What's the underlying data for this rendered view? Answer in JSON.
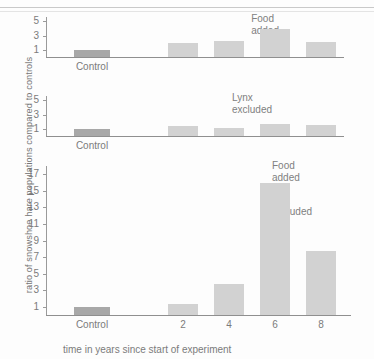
{
  "figure": {
    "y_axis_label": "ratio of snowshoe hare populations compared to controls",
    "x_axis_label": "time in years since start of experiment"
  },
  "chart_data": {
    "type": "bar",
    "title": "",
    "xlabel": "time in years since start of experiment",
    "ylabel": "ratio of snowshoe hare populations compared to controls",
    "categories": [
      "Control",
      "2",
      "4",
      "6",
      "8"
    ],
    "panels": [
      {
        "name": "Food added",
        "title": "Food added",
        "values": [
          1.0,
          2.0,
          2.3,
          3.9,
          2.1
        ],
        "ylim": [
          0,
          5.6
        ],
        "yticks": [
          1,
          3,
          5
        ],
        "ytick_labels": [
          "1",
          "3",
          "5"
        ]
      },
      {
        "name": "Lynx excluded",
        "title": "Lynx excluded",
        "values": [
          1.0,
          1.4,
          1.1,
          1.7,
          1.6
        ],
        "ylim": [
          0,
          5.6
        ],
        "yticks": [
          1,
          3,
          5
        ],
        "ytick_labels": [
          "1",
          "3",
          "5"
        ]
      },
      {
        "name": "Food added and lynx excluded",
        "title": "Food added and\nlynx excluded",
        "values": [
          1.0,
          1.3,
          3.8,
          16.0,
          7.7
        ],
        "ylim": [
          0,
          18.0
        ],
        "yticks": [
          1,
          3,
          5,
          7,
          9,
          11,
          13,
          15,
          17
        ],
        "ytick_labels": [
          "1",
          "3",
          "5",
          "7",
          "9",
          "11",
          "13",
          "15",
          "17"
        ]
      }
    ],
    "grid": false,
    "legend": "none"
  }
}
